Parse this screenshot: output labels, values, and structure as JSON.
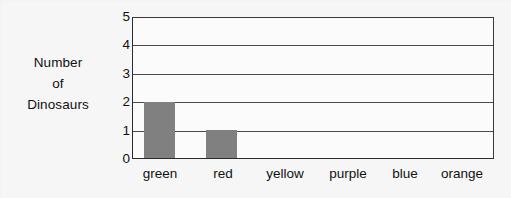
{
  "chart_data": {
    "type": "bar",
    "title": "",
    "xlabel": "",
    "ylabel": "Number of Dinosaurs",
    "ylabel_lines": [
      "Number",
      "of",
      "Dinosaurs"
    ],
    "categories": [
      "green",
      "red",
      "yellow",
      "purple",
      "blue",
      "orange"
    ],
    "values": [
      2,
      1,
      0,
      0,
      0,
      0
    ],
    "ylim": [
      0,
      5
    ],
    "ytick_labels": [
      "5",
      "4",
      "3",
      "2",
      "1",
      "0"
    ],
    "ytick_values": [
      5,
      4,
      3,
      2,
      1,
      0
    ],
    "grid": true,
    "legend": "none",
    "bar_color": "#808080",
    "axis_color": "#2b2b2b",
    "background_color": "#f6f6f6"
  }
}
